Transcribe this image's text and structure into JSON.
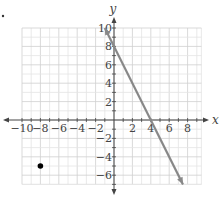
{
  "chart_data": {
    "type": "line",
    "title": "",
    "xlabel": "x",
    "ylabel": "y",
    "xlim": [
      -10,
      9.5
    ],
    "ylim": [
      -7,
      10
    ],
    "grid": true,
    "x_ticks": [
      -10,
      -8,
      -6,
      -4,
      -2,
      2,
      4,
      6,
      8
    ],
    "y_ticks": [
      10,
      8,
      6,
      4,
      2,
      -2,
      -4,
      -6
    ],
    "x_tick_labels": [
      "−10",
      "−8",
      "−6",
      "−4",
      "−2",
      "2",
      "4",
      "6",
      "8"
    ],
    "y_tick_labels": [
      "10",
      "8",
      "6",
      "4",
      "2",
      "−2",
      "−4",
      "−6"
    ],
    "series": [
      {
        "name": "line y = -2x + 8",
        "type": "line",
        "points": [
          [
            -1,
            10
          ],
          [
            0,
            8
          ],
          [
            4,
            0
          ],
          [
            7.5,
            -7
          ]
        ],
        "arrows": "both",
        "color": "#888888"
      },
      {
        "name": "point",
        "type": "scatter",
        "points": [
          [
            -8,
            -5
          ]
        ],
        "color": "#000000"
      }
    ]
  },
  "labels": {
    "bullet": "•"
  }
}
